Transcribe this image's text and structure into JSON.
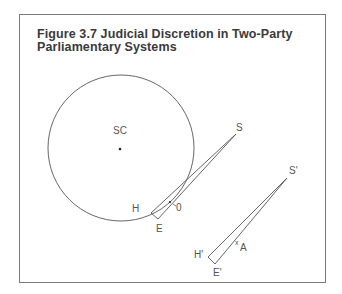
{
  "figure": {
    "title": "Figure 3.7 Judicial Discretion in Two-Party Parliamentary Systems",
    "title_line1": "Figure 3.7 Judicial Discretion in Two-Party",
    "title_line2": "Parliamentary Systems"
  },
  "diagram": {
    "circle": {
      "label": "SC",
      "cx": 121,
      "cy": 148,
      "r": 73
    },
    "wedge1": {
      "apex_label": "S",
      "corner1_label": "H",
      "corner2_label": "E",
      "point_label": "0"
    },
    "wedge2": {
      "apex_label": "S'",
      "corner1_label": "H'",
      "corner2_label": "E'",
      "point_label": "A"
    },
    "colors": {
      "line": "#555555",
      "frame": "#7a7a7a",
      "text": "#3a3a3a"
    }
  }
}
